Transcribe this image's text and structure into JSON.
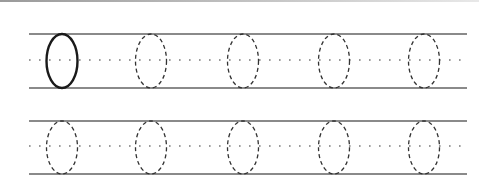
{
  "worksheet": {
    "title": "Letter O tracing practice",
    "letter": "O",
    "colors": {
      "guide_line": "#8a8a8a",
      "midline_dots": "#7a7a7a",
      "solid_oval": "#1a1a1a",
      "dashed_oval": "#333333",
      "top_border": "#9a9a9a"
    },
    "rows": [
      {
        "top_y": 34,
        "mid_y": 60,
        "bottom_y": 88,
        "ovals": [
          {
            "cx": 62,
            "style": "solid"
          },
          {
            "cx": 151,
            "style": "dashed"
          },
          {
            "cx": 243,
            "style": "dashed"
          },
          {
            "cx": 334,
            "style": "dashed"
          },
          {
            "cx": 424,
            "style": "dashed"
          }
        ]
      },
      {
        "top_y": 121,
        "mid_y": 146,
        "bottom_y": 174,
        "ovals": [
          {
            "cx": 62,
            "style": "dashed"
          },
          {
            "cx": 151,
            "style": "dashed"
          },
          {
            "cx": 243,
            "style": "dashed"
          },
          {
            "cx": 334,
            "style": "dashed"
          },
          {
            "cx": 424,
            "style": "dashed"
          }
        ]
      }
    ],
    "line_x_start": 29,
    "line_x_end": 467
  }
}
